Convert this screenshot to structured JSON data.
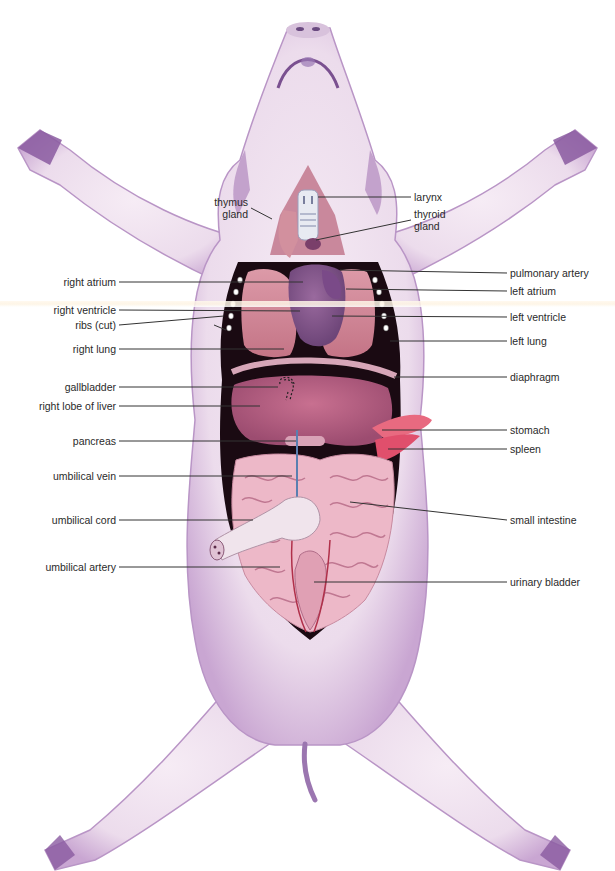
{
  "figure": {
    "colors": {
      "skin": "#efe0ee",
      "skin_shadow": "#b48fc3",
      "cavity": "#1a0a12",
      "liver": "#b8607f",
      "lung": "#d48a98",
      "heart": "#8a5a8e",
      "intestine": "#eab4c4",
      "stomach_spleen": "#e8607a",
      "vein": "#5a7fb0",
      "artery": "#b0304a",
      "leader_line": "#333333"
    }
  },
  "labels": {
    "left": [
      {
        "id": "thymus-gland",
        "text": "thymus\ngland",
        "x": 250,
        "y": 208,
        "target": [
          272,
          219
        ]
      },
      {
        "id": "right-atrium",
        "text": "right atrium",
        "x": 118,
        "y": 282,
        "target": [
          303,
          282
        ]
      },
      {
        "id": "right-ventricle",
        "text": "right ventricle",
        "x": 118,
        "y": 310,
        "target": [
          300,
          311
        ]
      },
      {
        "id": "ribs-cut",
        "text": "ribs (cut)",
        "x": 118,
        "y": 325,
        "target": [
          224,
          316
        ],
        "target2": [
          226,
          330
        ]
      },
      {
        "id": "right-lung",
        "text": "right lung",
        "x": 118,
        "y": 349,
        "target": [
          284,
          349
        ]
      },
      {
        "id": "gallbladder",
        "text": "gallbladder",
        "x": 118,
        "y": 387,
        "target": [
          278,
          387
        ]
      },
      {
        "id": "right-lobe-of-liver",
        "text": "right lobe of liver",
        "x": 118,
        "y": 406,
        "target": [
          260,
          406
        ]
      },
      {
        "id": "pancreas",
        "text": "pancreas",
        "x": 118,
        "y": 441,
        "target": [
          296,
          441
        ]
      },
      {
        "id": "umbilical-vein",
        "text": "umbilical vein",
        "x": 118,
        "y": 476,
        "target": [
          292,
          476
        ]
      },
      {
        "id": "umbilical-cord",
        "text": "umbilical cord",
        "x": 118,
        "y": 520,
        "target": [
          253,
          520
        ]
      },
      {
        "id": "umbilical-artery",
        "text": "umbilical artery",
        "x": 118,
        "y": 567,
        "target": [
          280,
          567
        ]
      }
    ],
    "right": [
      {
        "id": "larynx",
        "text": "larynx",
        "x": 412,
        "y": 197,
        "target": [
          318,
          197
        ]
      },
      {
        "id": "thyroid-gland",
        "text": "thyroid\ngland",
        "x": 412,
        "y": 220,
        "target": [
          316,
          240
        ]
      },
      {
        "id": "pulmonary-artery",
        "text": "pulmonary artery",
        "x": 508,
        "y": 273,
        "target": [
          340,
          270
        ]
      },
      {
        "id": "left-atrium",
        "text": "left atrium",
        "x": 508,
        "y": 291,
        "target": [
          346,
          289
        ]
      },
      {
        "id": "left-ventricle",
        "text": "left ventricle",
        "x": 508,
        "y": 317,
        "target": [
          332,
          316
        ]
      },
      {
        "id": "left-lung",
        "text": "left lung",
        "x": 508,
        "y": 341,
        "target": [
          390,
          341
        ]
      },
      {
        "id": "diaphragm",
        "text": "diaphragm",
        "x": 508,
        "y": 377,
        "target": [
          394,
          377
        ]
      },
      {
        "id": "stomach",
        "text": "stomach",
        "x": 508,
        "y": 430,
        "target": [
          382,
          430
        ]
      },
      {
        "id": "spleen",
        "text": "spleen",
        "x": 508,
        "y": 449,
        "target": [
          388,
          449
        ]
      },
      {
        "id": "small-intestine",
        "text": "small intestine",
        "x": 508,
        "y": 520,
        "target": [
          350,
          502
        ]
      },
      {
        "id": "urinary-bladder",
        "text": "urinary bladder",
        "x": 508,
        "y": 582,
        "target": [
          314,
          582
        ]
      }
    ]
  }
}
